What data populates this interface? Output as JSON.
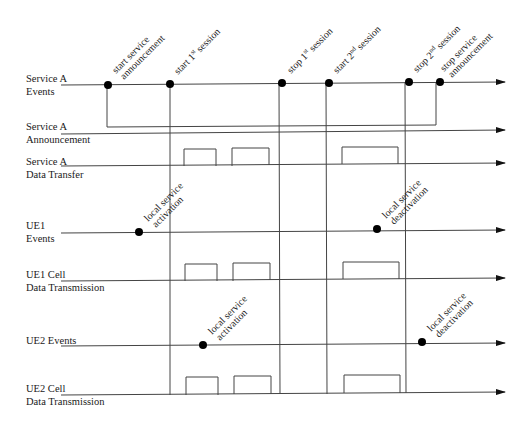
{
  "diagram": {
    "type": "timing-diagram",
    "colors": {
      "line": "#444444",
      "dot": "#000000",
      "text": "#1a1a1a"
    },
    "lanes": [
      {
        "id": "service-a-events",
        "label1": "Service A",
        "label2": "Events"
      },
      {
        "id": "service-a-announcement",
        "label1": "Service A",
        "label2": "Announcement"
      },
      {
        "id": "service-a-data-transfer",
        "label1": "Service A",
        "label2": "Data Transfer"
      },
      {
        "id": "ue1-events",
        "label1": "UE1",
        "label2": "Events"
      },
      {
        "id": "ue1-cell-data",
        "label1": "UE1 Cell",
        "label2": "Data Transmission"
      },
      {
        "id": "ue2-events",
        "label1": "UE2 Events",
        "label2": ""
      },
      {
        "id": "ue2-cell-data",
        "label1": "UE2 Cell",
        "label2": "Data Transmission"
      }
    ],
    "service_events": [
      {
        "line1": "start service",
        "line2": "announcement"
      },
      {
        "line1": "start 1",
        "sup": "st",
        "rest": " session"
      },
      {
        "line1": "stop 1",
        "sup": "st",
        "rest": " session"
      },
      {
        "line1": "start 2",
        "sup": "nd",
        "rest": " session"
      },
      {
        "line1": "stop 2",
        "sup": "nd",
        "rest": " session"
      },
      {
        "line1": "stop service",
        "line2": "announcement"
      }
    ],
    "ue1_events": [
      {
        "line1": "local service",
        "line2": "activation"
      },
      {
        "line1": "local service",
        "line2": "deactivation"
      }
    ],
    "ue2_events": [
      {
        "line1": "local service",
        "line2": "activation"
      },
      {
        "line1": "local service",
        "line2": "deactivation"
      }
    ]
  }
}
